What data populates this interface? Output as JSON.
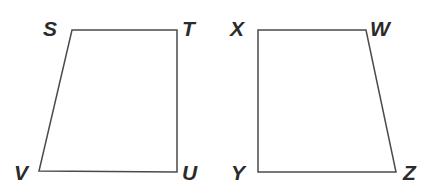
{
  "figure": {
    "background_color": "#ffffff",
    "stroke_color": "#4a4a4a",
    "stroke_width": 1.5,
    "label_color": "#2b2b2b",
    "width": 428,
    "height": 194
  },
  "shapes": [
    {
      "name": "quadrilateral-stuv",
      "label": "STUV",
      "type": "quadrilateral",
      "points": "72,30 177,30 177,172 39,171",
      "vertices": [
        {
          "id": "S",
          "letter": "S",
          "x": 72,
          "y": 30,
          "label_x": 43,
          "label_y": 18
        },
        {
          "id": "T",
          "letter": "T",
          "x": 177,
          "y": 30,
          "label_x": 182,
          "label_y": 18
        },
        {
          "id": "U",
          "letter": "U",
          "x": 177,
          "y": 172,
          "label_x": 182,
          "label_y": 162
        },
        {
          "id": "V",
          "letter": "V",
          "x": 39,
          "y": 171,
          "label_x": 14,
          "label_y": 162
        }
      ]
    },
    {
      "name": "quadrilateral-wxyz",
      "label": "WXYZ",
      "type": "quadrilateral",
      "points": "258,30 366,30 396,172 258,172",
      "vertices": [
        {
          "id": "X",
          "letter": "X",
          "x": 258,
          "y": 30,
          "label_x": 230,
          "label_y": 18
        },
        {
          "id": "W",
          "letter": "W",
          "x": 366,
          "y": 30,
          "label_x": 370,
          "label_y": 18
        },
        {
          "id": "Z",
          "letter": "Z",
          "x": 396,
          "y": 172,
          "label_x": 403,
          "label_y": 162
        },
        {
          "id": "Y",
          "letter": "Y",
          "x": 258,
          "y": 172,
          "label_x": 231,
          "label_y": 162
        }
      ]
    }
  ]
}
